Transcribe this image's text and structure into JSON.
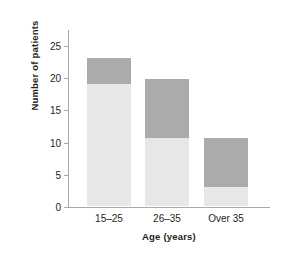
{
  "chart_data": {
    "type": "bar",
    "stacked": true,
    "title": "",
    "xlabel": "Age (years)",
    "ylabel": "Number of patients",
    "categories": [
      "15–25",
      "26–35",
      "Over 35"
    ],
    "series": [
      {
        "name": "lower-segment",
        "color": "#e6e7e8",
        "values": [
          19,
          10.5,
          3
        ]
      },
      {
        "name": "upper-segment",
        "color": "#aaabad",
        "values": [
          4,
          9.2,
          7.6
        ]
      }
    ],
    "totals": [
      23,
      19.7,
      10.6
    ],
    "ylim": [
      0,
      27.5
    ],
    "yticks": [
      0,
      5,
      10,
      15,
      20,
      25
    ],
    "ytick_labels": [
      "0",
      "5",
      "10",
      "15",
      "20",
      "25"
    ],
    "grid": false,
    "legend": "none"
  },
  "axes": {
    "axis_color": "#a7a9ac"
  }
}
